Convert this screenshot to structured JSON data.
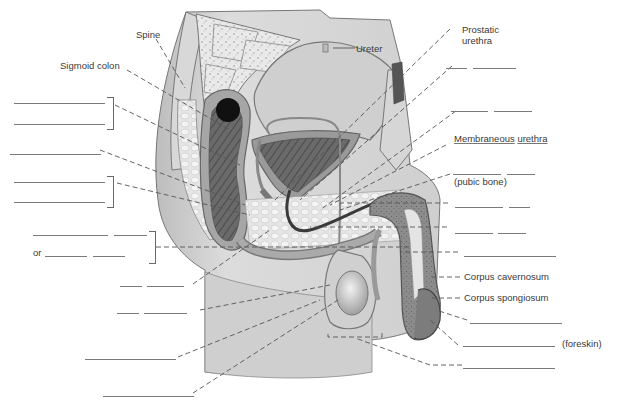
{
  "figure": {
    "colors": {
      "tissue_light": "#d9d9d9",
      "tissue_mid": "#a8a8a8",
      "tissue_dark": "#5a5a5a",
      "outline": "#6e6e6e",
      "leader": "#555555",
      "blank_line": "#7a7a7a",
      "text": "#3a3a3a"
    }
  },
  "labels": {
    "spine": "Spine",
    "sigmoid_colon": "Sigmoid colon",
    "ureter": "Ureter",
    "prostatic_urethra_1": "Prostatic",
    "prostatic_urethra_2": "urethra",
    "membraneous_urethra_a": "Membraneous",
    "membraneous_urethra_b": "urethra",
    "pubic_bone_hint": "(pubic bone)",
    "corpus_cavernosum": "Corpus cavernosum",
    "corpus_spongiosum": "Corpus spongiosum",
    "foreskin_hint": "(foreskin)",
    "or_text": "or"
  },
  "blanks": {
    "left": [
      {
        "id": "L1",
        "group": "bracket-1",
        "value": ""
      },
      {
        "id": "L2",
        "group": "bracket-1",
        "value": ""
      },
      {
        "id": "L3",
        "value": ""
      },
      {
        "id": "L4",
        "group": "bracket-2",
        "value": ""
      },
      {
        "id": "L5",
        "group": "bracket-2",
        "value": ""
      },
      {
        "id": "L6a",
        "group": "bracket-3",
        "value": ""
      },
      {
        "id": "L6b",
        "group": "bracket-3",
        "value": ""
      },
      {
        "id": "L7a",
        "group": "bracket-3",
        "prefix": "or",
        "value": ""
      },
      {
        "id": "L7b",
        "group": "bracket-3",
        "value": ""
      },
      {
        "id": "L8a",
        "value": ""
      },
      {
        "id": "L8b",
        "value": ""
      },
      {
        "id": "L9a",
        "value": ""
      },
      {
        "id": "L9b",
        "value": ""
      },
      {
        "id": "L10",
        "value": ""
      },
      {
        "id": "L11",
        "value": ""
      }
    ],
    "right": [
      {
        "id": "R1a",
        "value": ""
      },
      {
        "id": "R1b",
        "value": ""
      },
      {
        "id": "R2a",
        "value": ""
      },
      {
        "id": "R2b",
        "value": ""
      },
      {
        "id": "R3a",
        "hint": "(pubic bone)",
        "value": ""
      },
      {
        "id": "R3b",
        "value": ""
      },
      {
        "id": "R4a",
        "value": ""
      },
      {
        "id": "R4b",
        "value": ""
      },
      {
        "id": "R5a",
        "value": ""
      },
      {
        "id": "R5b",
        "value": ""
      },
      {
        "id": "R6",
        "value": ""
      },
      {
        "id": "R7",
        "value": ""
      },
      {
        "id": "R8",
        "hint": "(foreskin)",
        "value": ""
      },
      {
        "id": "R9",
        "value": ""
      }
    ]
  }
}
